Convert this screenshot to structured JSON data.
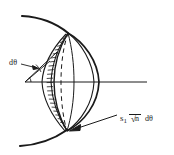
{
  "figure": {
    "type": "optics-ray-diagram",
    "background": "#ffffff",
    "ink": "#1a1a1a",
    "width": 174,
    "height": 155,
    "labels": {
      "angle_label": "dθ",
      "flux_symbol": "s",
      "flux_subscript": "1",
      "flux_radical_glyph": "√",
      "flux_radicand": "n",
      "flux_differential": "dθ"
    },
    "elements": {
      "wavefront_arc": "outer circular wavefront arc",
      "hatched_shell": "hatched annular shell band",
      "lens_body": "lens / cap solid of revolution",
      "dashed_ellipse": "hidden back rim of the cap (dashed)",
      "optical_axis": "horizontal optical axis line",
      "angle_vertex_marker": "small arc marking the angle at the vertex",
      "dtheta_leader": "leader line from dθ label to the angular wedge",
      "flux_leader": "leader arrow from s1 √n dθ label to the shell edge"
    },
    "geometry": {
      "vertex": [
        25,
        82
      ],
      "axis_start": [
        25,
        82
      ],
      "axis_end": [
        147,
        82
      ],
      "cap_apex_right": [
        99,
        82
      ],
      "shell_top": [
        62,
        31
      ],
      "shell_bottom": [
        62,
        133
      ]
    }
  }
}
